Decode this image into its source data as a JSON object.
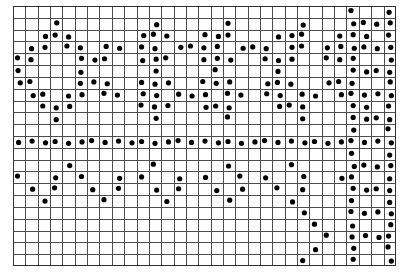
{
  "figure": {
    "kind": "dot-matrix-grid",
    "background_color": "#ffffff",
    "grid_line_color": "#4d4d4d",
    "grid_line_width": 1,
    "dot_color": "#000000",
    "border_color": "#333333"
  },
  "chart_data": {
    "type": "scatter",
    "title": "",
    "subtitle": "",
    "xlabel": "",
    "ylabel": "",
    "grid": true,
    "legend": false,
    "legend_position": "none",
    "columns": 31,
    "rows": 22,
    "xlim": [
      0,
      31
    ],
    "ylim": [
      0,
      22
    ],
    "x_tick_labels": [],
    "y_tick_labels": [],
    "marker": "filled-circle",
    "marker_radius_px": 2.6,
    "cell_width_px": 12.35,
    "cell_height_px": 11.82,
    "origin_px": [
      13,
      6
    ],
    "annotations": [],
    "points_note": "Each pair is [column_index, row_index], zero-based, column 0 = leftmost, row 0 = topmost.",
    "points": [
      [
        27,
        0
      ],
      [
        30,
        0
      ],
      [
        3,
        1
      ],
      [
        11,
        1
      ],
      [
        17,
        1
      ],
      [
        23,
        1
      ],
      [
        27,
        1
      ],
      [
        28,
        1
      ],
      [
        29,
        1
      ],
      [
        30,
        1
      ],
      [
        2,
        2
      ],
      [
        3,
        2
      ],
      [
        4,
        2
      ],
      [
        10,
        2
      ],
      [
        11,
        2
      ],
      [
        12,
        2
      ],
      [
        15,
        2
      ],
      [
        16,
        2
      ],
      [
        17,
        2
      ],
      [
        21,
        2
      ],
      [
        22,
        2
      ],
      [
        23,
        2
      ],
      [
        26,
        2
      ],
      [
        27,
        2
      ],
      [
        28,
        2
      ],
      [
        30,
        2
      ],
      [
        1,
        3
      ],
      [
        2,
        3
      ],
      [
        4,
        3
      ],
      [
        5,
        3
      ],
      [
        7,
        3
      ],
      [
        8,
        3
      ],
      [
        10,
        3
      ],
      [
        11,
        3
      ],
      [
        13,
        3
      ],
      [
        14,
        3
      ],
      [
        15,
        3
      ],
      [
        16,
        3
      ],
      [
        18,
        3
      ],
      [
        19,
        3
      ],
      [
        20,
        3
      ],
      [
        22,
        3
      ],
      [
        23,
        3
      ],
      [
        25,
        3
      ],
      [
        26,
        3
      ],
      [
        27,
        3
      ],
      [
        28,
        3
      ],
      [
        29,
        3
      ],
      [
        30,
        3
      ],
      [
        0,
        4
      ],
      [
        1,
        4
      ],
      [
        5,
        4
      ],
      [
        6,
        4
      ],
      [
        7,
        4
      ],
      [
        10,
        4
      ],
      [
        11,
        4
      ],
      [
        12,
        4
      ],
      [
        15,
        4
      ],
      [
        16,
        4
      ],
      [
        17,
        4
      ],
      [
        20,
        4
      ],
      [
        21,
        4
      ],
      [
        22,
        4
      ],
      [
        25,
        4
      ],
      [
        26,
        4
      ],
      [
        27,
        4
      ],
      [
        30,
        4
      ],
      [
        0,
        5
      ],
      [
        5,
        5
      ],
      [
        11,
        5
      ],
      [
        16,
        5
      ],
      [
        21,
        5
      ],
      [
        27,
        5
      ],
      [
        28,
        5
      ],
      [
        29,
        5
      ],
      [
        30,
        5
      ],
      [
        0,
        6
      ],
      [
        1,
        6
      ],
      [
        5,
        6
      ],
      [
        6,
        6
      ],
      [
        7,
        6
      ],
      [
        10,
        6
      ],
      [
        11,
        6
      ],
      [
        12,
        6
      ],
      [
        15,
        6
      ],
      [
        16,
        6
      ],
      [
        17,
        6
      ],
      [
        20,
        6
      ],
      [
        21,
        6
      ],
      [
        22,
        6
      ],
      [
        25,
        6
      ],
      [
        26,
        6
      ],
      [
        27,
        6
      ],
      [
        30,
        6
      ],
      [
        1,
        7
      ],
      [
        2,
        7
      ],
      [
        4,
        7
      ],
      [
        5,
        7
      ],
      [
        7,
        7
      ],
      [
        8,
        7
      ],
      [
        10,
        7
      ],
      [
        11,
        7
      ],
      [
        13,
        7
      ],
      [
        14,
        7
      ],
      [
        15,
        7
      ],
      [
        17,
        7
      ],
      [
        18,
        7
      ],
      [
        20,
        7
      ],
      [
        21,
        7
      ],
      [
        23,
        7
      ],
      [
        24,
        7
      ],
      [
        26,
        7
      ],
      [
        27,
        7
      ],
      [
        28,
        7
      ],
      [
        29,
        7
      ],
      [
        30,
        7
      ],
      [
        2,
        8
      ],
      [
        3,
        8
      ],
      [
        4,
        8
      ],
      [
        10,
        8
      ],
      [
        11,
        8
      ],
      [
        12,
        8
      ],
      [
        15,
        8
      ],
      [
        16,
        8
      ],
      [
        17,
        8
      ],
      [
        21,
        8
      ],
      [
        22,
        8
      ],
      [
        23,
        8
      ],
      [
        27,
        8
      ],
      [
        28,
        8
      ],
      [
        30,
        8
      ],
      [
        3,
        9
      ],
      [
        11,
        9
      ],
      [
        17,
        9
      ],
      [
        23,
        9
      ],
      [
        27,
        9
      ],
      [
        28,
        9
      ],
      [
        29,
        9
      ],
      [
        30,
        9
      ],
      [
        27,
        10
      ],
      [
        30,
        10
      ],
      [
        0,
        11
      ],
      [
        1,
        11
      ],
      [
        2,
        11
      ],
      [
        3,
        11
      ],
      [
        4,
        11
      ],
      [
        5,
        11
      ],
      [
        6,
        11
      ],
      [
        7,
        11
      ],
      [
        8,
        11
      ],
      [
        9,
        11
      ],
      [
        10,
        11
      ],
      [
        11,
        11
      ],
      [
        12,
        11
      ],
      [
        13,
        11
      ],
      [
        14,
        11
      ],
      [
        15,
        11
      ],
      [
        16,
        11
      ],
      [
        17,
        11
      ],
      [
        18,
        11
      ],
      [
        19,
        11
      ],
      [
        20,
        11
      ],
      [
        21,
        11
      ],
      [
        22,
        11
      ],
      [
        23,
        11
      ],
      [
        24,
        11
      ],
      [
        25,
        11
      ],
      [
        26,
        11
      ],
      [
        27,
        11
      ],
      [
        28,
        11
      ],
      [
        29,
        11
      ],
      [
        30,
        11
      ],
      [
        27,
        12
      ],
      [
        30,
        12
      ],
      [
        4,
        13
      ],
      [
        11,
        13
      ],
      [
        17,
        13
      ],
      [
        22,
        13
      ],
      [
        27,
        13
      ],
      [
        28,
        13
      ],
      [
        29,
        13
      ],
      [
        30,
        13
      ],
      [
        0,
        14
      ],
      [
        3,
        14
      ],
      [
        5,
        14
      ],
      [
        8,
        14
      ],
      [
        10,
        14
      ],
      [
        13,
        14
      ],
      [
        15,
        14
      ],
      [
        18,
        14
      ],
      [
        20,
        14
      ],
      [
        23,
        14
      ],
      [
        26,
        14
      ],
      [
        27,
        14
      ],
      [
        30,
        14
      ],
      [
        1,
        15
      ],
      [
        3,
        15
      ],
      [
        6,
        15
      ],
      [
        8,
        15
      ],
      [
        11,
        15
      ],
      [
        13,
        15
      ],
      [
        16,
        15
      ],
      [
        18,
        15
      ],
      [
        21,
        15
      ],
      [
        23,
        15
      ],
      [
        27,
        15
      ],
      [
        28,
        15
      ],
      [
        29,
        15
      ],
      [
        30,
        15
      ],
      [
        2,
        16
      ],
      [
        7,
        16
      ],
      [
        12,
        16
      ],
      [
        17,
        16
      ],
      [
        22,
        16
      ],
      [
        27,
        16
      ],
      [
        30,
        16
      ],
      [
        23,
        17
      ],
      [
        27,
        17
      ],
      [
        28,
        17
      ],
      [
        29,
        17
      ],
      [
        30,
        17
      ],
      [
        24,
        18
      ],
      [
        27,
        18
      ],
      [
        30,
        18
      ],
      [
        25,
        19
      ],
      [
        27,
        19
      ],
      [
        28,
        19
      ],
      [
        29,
        19
      ],
      [
        30,
        19
      ],
      [
        24,
        20
      ],
      [
        27,
        20
      ],
      [
        30,
        20
      ],
      [
        23,
        21
      ],
      [
        27,
        21
      ],
      [
        30,
        21
      ]
    ]
  }
}
